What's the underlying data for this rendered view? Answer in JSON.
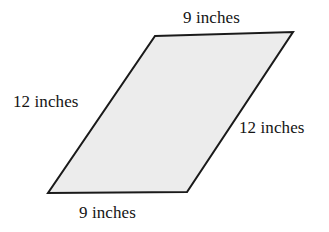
{
  "figure": {
    "type": "geometry-diagram",
    "shape_name": "parallelogram",
    "background_color": "#ffffff",
    "fill_color": "#ececec",
    "stroke_color": "#1a1a1a",
    "stroke_width": 2,
    "text_color": "#141414",
    "vertices": [
      {
        "name": "top-left",
        "x": 155,
        "y": 36
      },
      {
        "name": "top-right",
        "x": 293,
        "y": 32
      },
      {
        "name": "bottom-right",
        "x": 187,
        "y": 192
      },
      {
        "name": "bottom-left",
        "x": 48,
        "y": 193
      }
    ],
    "labels": {
      "top": "9 inches",
      "left": "12 inches",
      "right": "12 inches",
      "bottom": "9 inches"
    }
  }
}
